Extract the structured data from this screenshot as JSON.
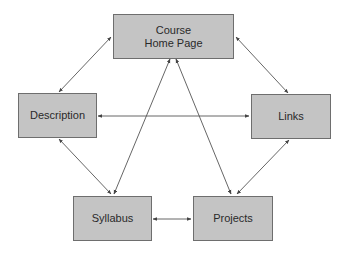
{
  "diagram": {
    "nodes": {
      "course_home": {
        "line1": "Course",
        "line2": "Home Page"
      },
      "description": {
        "label": "Description"
      },
      "links": {
        "label": "Links"
      },
      "syllabus": {
        "label": "Syllabus"
      },
      "projects": {
        "label": "Projects"
      }
    },
    "edges": [
      {
        "from": "Course Home Page",
        "to": "Description",
        "type": "bidirectional"
      },
      {
        "from": "Course Home Page",
        "to": "Links",
        "type": "bidirectional"
      },
      {
        "from": "Course Home Page",
        "to": "Syllabus",
        "type": "bidirectional"
      },
      {
        "from": "Course Home Page",
        "to": "Projects",
        "type": "bidirectional"
      },
      {
        "from": "Description",
        "to": "Links",
        "type": "bidirectional"
      },
      {
        "from": "Description",
        "to": "Syllabus",
        "type": "bidirectional"
      },
      {
        "from": "Links",
        "to": "Projects",
        "type": "bidirectional"
      },
      {
        "from": "Syllabus",
        "to": "Projects",
        "type": "bidirectional"
      }
    ],
    "colors": {
      "node_fill": "#c4c4c4",
      "node_border": "#6e6e6e",
      "edge": "#555555",
      "text": "#2a2a2a"
    }
  }
}
